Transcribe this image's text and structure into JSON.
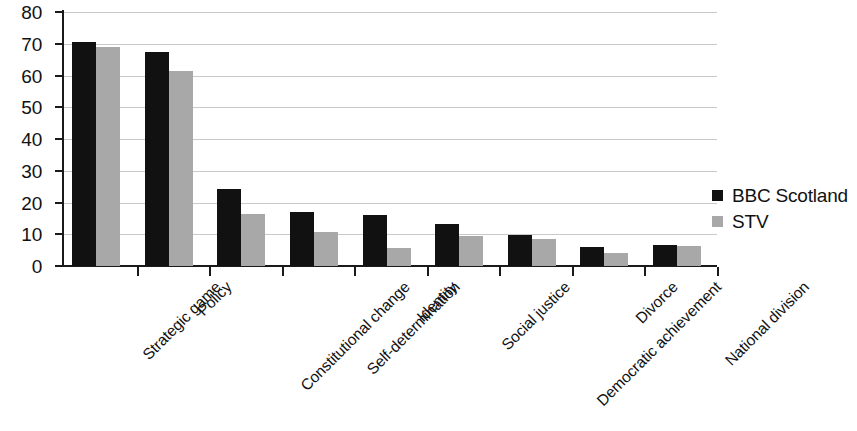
{
  "chart_data": {
    "type": "bar",
    "title": "",
    "subtitle": "",
    "xlabel": "",
    "ylabel": "",
    "ylim": [
      0,
      80
    ],
    "yticks": [
      0,
      10,
      20,
      30,
      40,
      50,
      60,
      70,
      80
    ],
    "grid": true,
    "legend_position": "right",
    "categories": [
      "Strategic game",
      "Policy",
      "Constitutional change",
      "Self-determination",
      "Identity",
      "Social justice",
      "Democratic achievement",
      "Divorce",
      "National division"
    ],
    "series": [
      {
        "name": "BBC Scotland",
        "color": "#111111",
        "values": [
          70.5,
          67.5,
          24.3,
          17,
          16.2,
          13.2,
          9.8,
          6,
          6.5
        ]
      },
      {
        "name": "STV",
        "color": "#a8a8a8",
        "values": [
          69,
          61.5,
          16.4,
          10.7,
          5.8,
          9.6,
          8.5,
          4,
          6.3
        ]
      }
    ]
  },
  "legend": {
    "items": [
      {
        "label": "BBC Scotland",
        "color": "#111111"
      },
      {
        "label": "STV",
        "color": "#a8a8a8"
      }
    ]
  }
}
